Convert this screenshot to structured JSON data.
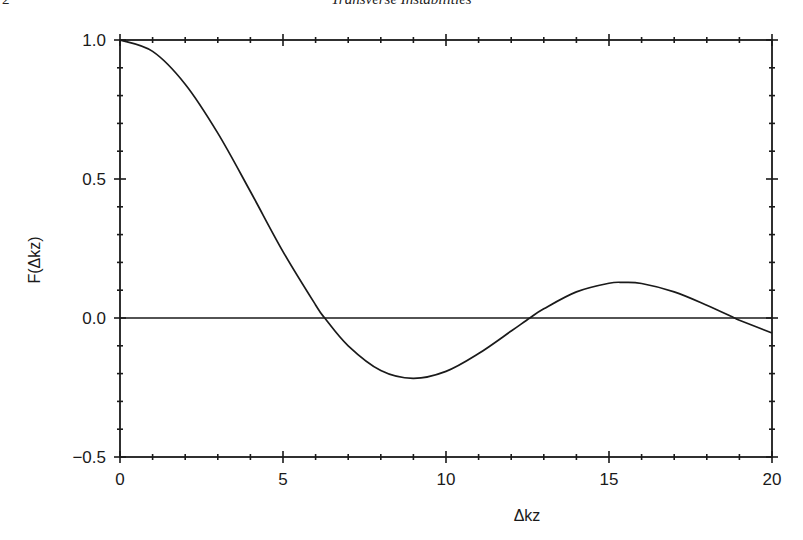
{
  "page": {
    "page_number": "2",
    "running_head": "Transverse Instabilities"
  },
  "chart_data": {
    "type": "line",
    "title": "",
    "xlabel": "Δkz",
    "ylabel": "F(Δkz)",
    "xlim": [
      0,
      20
    ],
    "ylim": [
      -0.5,
      1.0
    ],
    "x_ticks": [
      0,
      5,
      10,
      15,
      20
    ],
    "x_tick_labels": [
      "0",
      "5",
      "10",
      "15",
      "20"
    ],
    "x_minor_step": 1,
    "y_ticks": [
      -0.5,
      0.0,
      0.5,
      1.0
    ],
    "y_tick_labels": [
      "−0.5",
      "0.0",
      "0.5",
      "1.0"
    ],
    "y_minor_step": 0.1,
    "grid": false,
    "legend": null,
    "reference_lines": [
      {
        "axis": "y",
        "value": 0.0
      }
    ],
    "series": [
      {
        "name": "F(Δkz) = sin(Δkz/2)/(Δkz/2)",
        "x": [
          0,
          1,
          2,
          3,
          4,
          5,
          6,
          6.28,
          7,
          8,
          8.99,
          10,
          11,
          12,
          12.57,
          13,
          14,
          15,
          15.45,
          16,
          17,
          18,
          18.85,
          19,
          20
        ],
        "values": [
          1.0,
          0.959,
          0.841,
          0.665,
          0.455,
          0.239,
          0.047,
          0.0,
          -0.1,
          -0.189,
          -0.217,
          -0.192,
          -0.128,
          -0.047,
          0.0,
          0.033,
          0.094,
          0.125,
          0.128,
          0.124,
          0.094,
          0.046,
          0.0,
          -0.008,
          -0.054
        ]
      }
    ],
    "annotations": []
  }
}
